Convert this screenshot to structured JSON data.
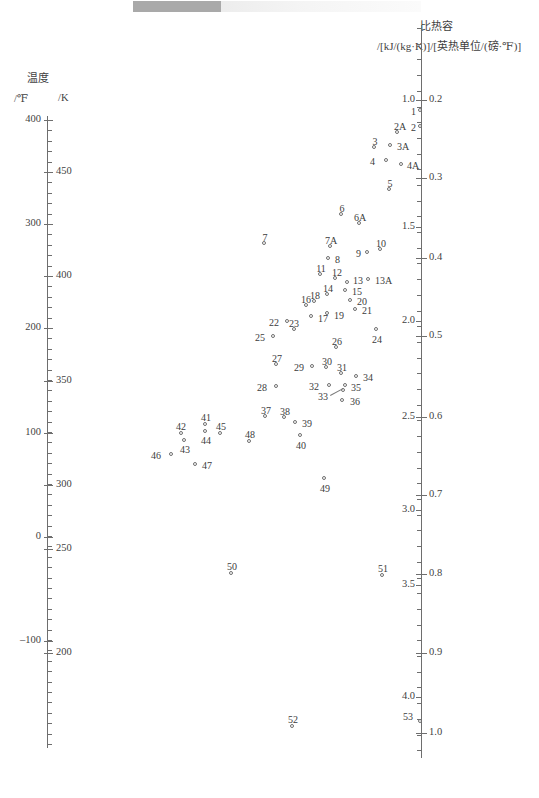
{
  "page": {
    "scan_artifact": "top-edge-scan-bar"
  },
  "left_axis": {
    "title": "温度",
    "unit_primary": "/℉",
    "unit_secondary": "/K",
    "f_labels": [
      "400",
      "300",
      "200",
      "100",
      "0",
      "–100"
    ],
    "k_labels": [
      "450",
      "400",
      "350",
      "300",
      "250",
      "200"
    ],
    "f_range": [
      -140,
      420
    ],
    "k_range": [
      177.6,
      488.7
    ]
  },
  "right_axis": {
    "title": "比热容",
    "units": "/[kJ/(kg·K)]/[英热单位/(磅·℉)]",
    "si_labels": [
      "1.0",
      "1.5",
      "2.0",
      "2.5",
      "3.0",
      "3.5",
      "4.0"
    ],
    "imperial_labels": [
      "0.2",
      "0.3",
      "0.4",
      "0.5",
      "0.6",
      "0.7",
      "0.8",
      "0.9",
      "1.0"
    ],
    "si_range": [
      0.82,
      4.25
    ],
    "imperial_range": [
      0.196,
      1.015
    ]
  },
  "chart_data": {
    "type": "scatter",
    "title": "比热容",
    "xlabel": "",
    "ylabel": "温度 /℉ , /K",
    "grid": false,
    "legend": "none",
    "axis_note": "Nomograph-style dual scatter: left axis = temperature (℉ and K), right axis = specific heat capacity (kJ/(kg·K) and Btu/(lb·℉))",
    "x_axis_range_px": [
      47,
      421
    ],
    "points": [
      {
        "id": "1",
        "px": 421,
        "py": 111,
        "label_dx": -9,
        "label_dy": -5,
        "label_pos": "left"
      },
      {
        "id": "2",
        "px": 421,
        "py": 127,
        "label_dx": -9,
        "label_dy": -5,
        "label_pos": "left"
      },
      {
        "id": "2A",
        "px": 398,
        "py": 133,
        "label_dx": 1,
        "label_dy": -12,
        "label_pos": "above"
      },
      {
        "id": "3",
        "px": 375,
        "py": 148,
        "label_dx": -1,
        "label_dy": -12,
        "label_pos": "above"
      },
      {
        "id": "3A",
        "px": 391,
        "py": 146,
        "label_dx": 6,
        "label_dy": -5,
        "label_pos": "right"
      },
      {
        "id": "4",
        "px": 387,
        "py": 161,
        "label_dx": -16,
        "label_dy": -5,
        "label_pos": "left"
      },
      {
        "id": "4A",
        "px": 402,
        "py": 165,
        "label_dx": 5,
        "label_dy": -5,
        "label_pos": "right"
      },
      {
        "id": "5",
        "px": 390,
        "py": 190,
        "label_dx": -1,
        "label_dy": -12,
        "label_pos": "above"
      },
      {
        "id": "6",
        "px": 342,
        "py": 215,
        "label_dx": -1,
        "label_dy": -12,
        "label_pos": "above"
      },
      {
        "id": "6A",
        "px": 360,
        "py": 224,
        "label_dx": -1,
        "label_dy": -12,
        "label_pos": "above"
      },
      {
        "id": "7",
        "px": 265,
        "py": 244,
        "label_dx": -1,
        "label_dy": -12,
        "label_pos": "above"
      },
      {
        "id": "7A",
        "px": 331,
        "py": 247,
        "label_dx": -1,
        "label_dy": -12,
        "label_pos": "above"
      },
      {
        "id": "8",
        "px": 329,
        "py": 259,
        "label_dx": 6,
        "label_dy": -5,
        "label_pos": "right"
      },
      {
        "id": "9",
        "px": 368,
        "py": 253,
        "label_dx": -11,
        "label_dy": -5,
        "label_pos": "left"
      },
      {
        "id": "10",
        "px": 381,
        "py": 250,
        "label_dx": -1,
        "label_dy": -12,
        "label_pos": "above"
      },
      {
        "id": "11",
        "px": 321,
        "py": 275,
        "label_dx": -1,
        "label_dy": -12,
        "label_pos": "above"
      },
      {
        "id": "12",
        "px": 336,
        "py": 279,
        "label_dx": 0,
        "label_dy": -12,
        "label_pos": "above"
      },
      {
        "id": "13",
        "px": 348,
        "py": 283,
        "label_dx": 5,
        "label_dy": -8,
        "label_pos": "right"
      },
      {
        "id": "13A",
        "px": 369,
        "py": 280,
        "label_dx": 6,
        "label_dy": -5,
        "label_pos": "right"
      },
      {
        "id": "14",
        "px": 328,
        "py": 295,
        "label_dx": -1,
        "label_dy": -12,
        "label_pos": "above"
      },
      {
        "id": "15",
        "px": 346,
        "py": 291,
        "label_dx": 6,
        "label_dy": -5,
        "label_pos": "right"
      },
      {
        "id": "16",
        "px": 307,
        "py": 306,
        "label_dx": -2,
        "label_dy": -12,
        "label_pos": "above"
      },
      {
        "id": "17",
        "px": 312,
        "py": 317,
        "label_dx": 6,
        "label_dy": -4,
        "label_pos": "right"
      },
      {
        "id": "18",
        "px": 315,
        "py": 302,
        "label_dx": -1,
        "label_dy": -12,
        "label_pos": "above"
      },
      {
        "id": "19",
        "px": 328,
        "py": 314,
        "label_dx": 6,
        "label_dy": -4,
        "label_pos": "right"
      },
      {
        "id": "20",
        "px": 351,
        "py": 301,
        "label_dx": 6,
        "label_dy": -5,
        "label_pos": "right"
      },
      {
        "id": "21",
        "px": 356,
        "py": 310,
        "label_dx": 6,
        "label_dy": -5,
        "label_pos": "right"
      },
      {
        "id": "22",
        "px": 288,
        "py": 322,
        "label_dx": -13,
        "label_dy": -5,
        "label_pos": "left"
      },
      {
        "id": "23",
        "px": 295,
        "py": 330,
        "label_dx": -2,
        "label_dy": -12,
        "label_pos": "above"
      },
      {
        "id": "24",
        "px": 377,
        "py": 330,
        "label_dx": -1,
        "label_dy": 4,
        "label_pos": "below"
      },
      {
        "id": "25",
        "px": 274,
        "py": 337,
        "label_dx": -13,
        "label_dy": -5,
        "label_pos": "left"
      },
      {
        "id": "26",
        "px": 337,
        "py": 348,
        "label_dx": -1,
        "label_dy": -12,
        "label_pos": "above"
      },
      {
        "id": "27",
        "px": 277,
        "py": 365,
        "label_dx": -1,
        "label_dy": -12,
        "label_pos": "above"
      },
      {
        "id": "28",
        "px": 277,
        "py": 387,
        "label_dx": -14,
        "label_dy": -5,
        "label_pos": "left"
      },
      {
        "id": "29",
        "px": 313,
        "py": 367,
        "label_dx": -13,
        "label_dy": -5,
        "label_pos": "left"
      },
      {
        "id": "30",
        "px": 327,
        "py": 368,
        "label_dx": -1,
        "label_dy": -12,
        "label_pos": "above"
      },
      {
        "id": "31",
        "px": 342,
        "py": 374,
        "label_dx": -1,
        "label_dy": -12,
        "label_pos": "above"
      },
      {
        "id": "32",
        "px": 330,
        "py": 386,
        "label_dx": -15,
        "label_dy": -5,
        "label_pos": "left"
      },
      {
        "id": "33",
        "px": 344,
        "py": 391,
        "label_dx": -20,
        "label_dy": 0,
        "label_pos": "leader-left"
      },
      {
        "id": "34",
        "px": 357,
        "py": 377,
        "label_dx": 6,
        "label_dy": -5,
        "label_pos": "right"
      },
      {
        "id": "35",
        "px": 346,
        "py": 386,
        "label_dx": 5,
        "label_dy": -4,
        "label_pos": "right"
      },
      {
        "id": "36",
        "px": 343,
        "py": 401,
        "label_dx": 7,
        "label_dy": -5,
        "label_pos": "right"
      },
      {
        "id": "37",
        "px": 266,
        "py": 417,
        "label_dx": -1,
        "label_dy": -12,
        "label_pos": "above"
      },
      {
        "id": "38",
        "px": 285,
        "py": 418,
        "label_dx": -1,
        "label_dy": -12,
        "label_pos": "above"
      },
      {
        "id": "39",
        "px": 296,
        "py": 423,
        "label_dx": 6,
        "label_dy": -5,
        "label_pos": "right"
      },
      {
        "id": "40",
        "px": 301,
        "py": 436,
        "label_dx": -1,
        "label_dy": 4,
        "label_pos": "below"
      },
      {
        "id": "41",
        "px": 206,
        "py": 425,
        "label_dx": -1,
        "label_dy": -13,
        "label_pos": "above"
      },
      {
        "id": "42",
        "px": 182,
        "py": 434,
        "label_dx": -2,
        "label_dy": -13,
        "label_pos": "above"
      },
      {
        "id": "43",
        "px": 185,
        "py": 441,
        "label_dx": -1,
        "label_dy": 3,
        "label_pos": "below"
      },
      {
        "id": "44",
        "px": 206,
        "py": 432,
        "label_dx": -1,
        "label_dy": 3,
        "label_pos": "below"
      },
      {
        "id": "45",
        "px": 221,
        "py": 434,
        "label_dx": -1,
        "label_dy": -13,
        "label_pos": "above"
      },
      {
        "id": "46",
        "px": 172,
        "py": 455,
        "label_dx": -15,
        "label_dy": -5,
        "label_pos": "left"
      },
      {
        "id": "47",
        "px": 196,
        "py": 465,
        "label_dx": 6,
        "label_dy": -5,
        "label_pos": "right"
      },
      {
        "id": "48",
        "px": 250,
        "py": 442,
        "label_dx": -1,
        "label_dy": -13,
        "label_pos": "above"
      },
      {
        "id": "49",
        "px": 325,
        "py": 479,
        "label_dx": -1,
        "label_dy": 4,
        "label_pos": "below"
      },
      {
        "id": "50",
        "px": 232,
        "py": 574,
        "label_dx": -1,
        "label_dy": -13,
        "label_pos": "above"
      },
      {
        "id": "51",
        "px": 383,
        "py": 576,
        "label_dx": -1,
        "label_dy": -13,
        "label_pos": "above"
      },
      {
        "id": "52",
        "px": 293,
        "py": 727,
        "label_dx": -1,
        "label_dy": -13,
        "label_pos": "above"
      },
      {
        "id": "53",
        "px": 421,
        "py": 722,
        "label_dx": -12,
        "label_dy": -11,
        "label_pos": "above-left"
      }
    ]
  },
  "left_axis_ticks": {
    "f_major": [
      {
        "value": "400",
        "py": 120
      },
      {
        "value": "300",
        "py": 224
      },
      {
        "value": "200",
        "py": 328
      },
      {
        "value": "100",
        "py": 433
      },
      {
        "value": "0",
        "py": 537
      },
      {
        "value": "–100",
        "py": 641
      }
    ],
    "k_major": [
      {
        "value": "450",
        "py": 172
      },
      {
        "value": "400",
        "py": 276
      },
      {
        "value": "350",
        "py": 381
      },
      {
        "value": "300",
        "py": 485
      },
      {
        "value": "250",
        "py": 549
      },
      {
        "value": "200",
        "py": 653
      }
    ]
  },
  "right_axis_ticks": {
    "si_major": [
      {
        "value": "1.0",
        "py": 100
      },
      {
        "value": "1.5",
        "py": 227
      },
      {
        "value": "2.0",
        "py": 321
      },
      {
        "value": "2.5",
        "py": 417
      },
      {
        "value": "3.0",
        "py": 510
      },
      {
        "value": "3.5",
        "py": 585
      },
      {
        "value": "4.0",
        "py": 697
      }
    ],
    "imp_major": [
      {
        "value": "0.2",
        "py": 100
      },
      {
        "value": "0.3",
        "py": 178
      },
      {
        "value": "0.4",
        "py": 258
      },
      {
        "value": "0.5",
        "py": 336
      },
      {
        "value": "0.6",
        "py": 417
      },
      {
        "value": "0.7",
        "py": 495
      },
      {
        "value": "0.8",
        "py": 574
      },
      {
        "value": "0.9",
        "py": 653
      },
      {
        "value": "1.0",
        "py": 733
      }
    ]
  }
}
